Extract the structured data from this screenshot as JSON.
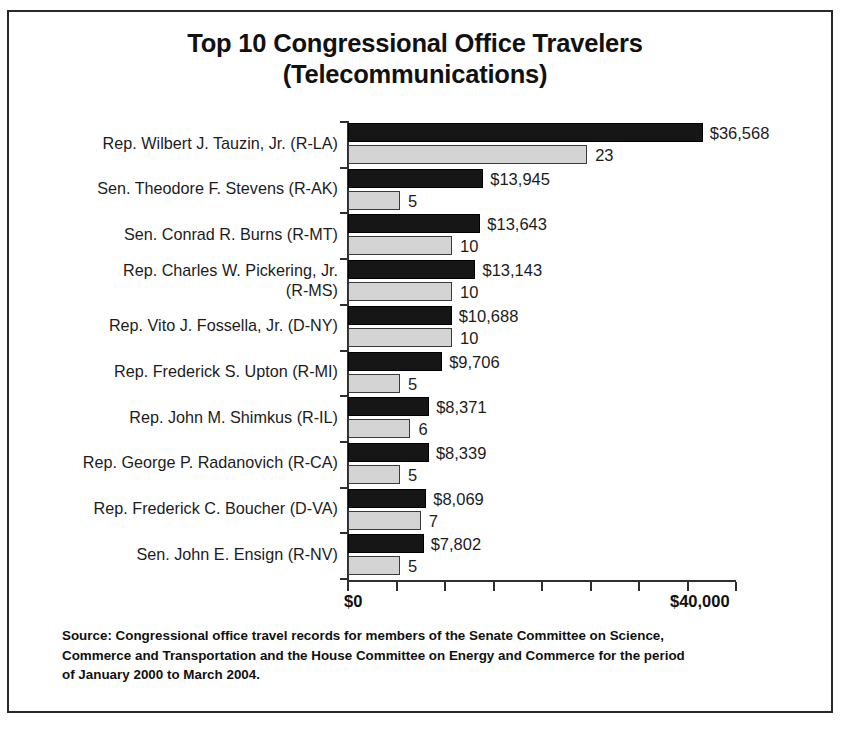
{
  "chart_data": {
    "type": "bar",
    "orientation": "horizontal",
    "title": "Top 10 Congressional Office Travelers (Telecommunications)",
    "title_lines": [
      "Top 10 Congressional Office Travelers",
      "(Telecommunications)"
    ],
    "xlabel": "",
    "ylabel": "",
    "grid": false,
    "legend": "none",
    "xlim": [
      0,
      40000
    ],
    "xticks": [
      0,
      5000,
      10000,
      15000,
      20000,
      25000,
      30000,
      35000,
      40000
    ],
    "xticklabels": [
      "$0",
      "",
      "",
      "",
      "",
      "",
      "",
      "",
      "$40,000"
    ],
    "categories": [
      "Rep. Wilbert J. Tauzin, Jr. (R-LA)",
      "Sen. Theodore F. Stevens (R-AK)",
      "Sen. Conrad R. Burns (R-MT)",
      "Rep. Charles W. Pickering, Jr. (R-MS)",
      "Rep. Vito J. Fossella, Jr. (D-NY)",
      "Rep. Frederick S. Upton (R-MI)",
      "Rep. John M. Shimkus (R-IL)",
      "Rep. George P. Radanovich (R-CA)",
      "Rep. Frederick C. Boucher (D-VA)",
      "Sen. John E. Ensign (R-NV)"
    ],
    "category_label_lines": [
      [
        "Rep. Wilbert J. Tauzin, Jr. (R-LA)"
      ],
      [
        "Sen. Theodore F. Stevens (R-AK)"
      ],
      [
        "Sen. Conrad R. Burns (R-MT)"
      ],
      [
        "Rep. Charles W. Pickering, Jr.",
        "(R-MS)"
      ],
      [
        "Rep. Vito J. Fossella, Jr. (D-NY)"
      ],
      [
        "Rep. Frederick S. Upton (R-MI)"
      ],
      [
        "Rep. John M. Shimkus (R-IL)"
      ],
      [
        "Rep. George P. Radanovich (R-CA)"
      ],
      [
        "Rep. Frederick C. Boucher (D-VA)"
      ],
      [
        "Sen. John E. Ensign (R-NV)"
      ]
    ],
    "series": [
      {
        "name": "Travel cost",
        "color": "#161616",
        "values": [
          36568,
          13945,
          13643,
          13143,
          10688,
          9706,
          8371,
          8339,
          8069,
          7802
        ],
        "labels": [
          "$36,568",
          "$13,945",
          "$13,643",
          "$13,143",
          "$10,688",
          "$9,706",
          "$8,371",
          "$8,339",
          "$8,069",
          "$7,802"
        ]
      },
      {
        "name": "Number of trips",
        "color": "#d4d4d4",
        "values": [
          23,
          5,
          10,
          10,
          10,
          5,
          6,
          5,
          7,
          5
        ],
        "labels": [
          "23",
          "5",
          "10",
          "10",
          "10",
          "5",
          "6",
          "5",
          "7",
          "5"
        ]
      }
    ]
  },
  "source": {
    "lines": [
      "Source: Congressional office travel records for members of the Senate Committee on Science,",
      "Commerce and Transportation and the House Committee on Energy and Commerce for the period",
      "of January 2000 to March 2004."
    ]
  },
  "colors": {
    "dollar_bar": "#161616",
    "trip_bar": "#d4d4d4",
    "axis": "#2f2f2f",
    "text": "#1c1c1c",
    "background": "#ffffff"
  }
}
